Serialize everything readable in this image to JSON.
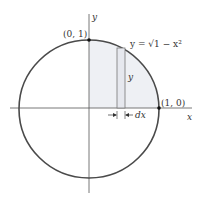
{
  "diagram": {
    "axis_x_label": "x",
    "axis_y_label": "y",
    "point_top_label": "(0, 1)",
    "point_right_label": "(1, 0)",
    "curve_label": "y = √1 − x²",
    "strip_height_label": "y",
    "strip_width_label": "dx",
    "colors": {
      "circle": "#4a4a4a",
      "axes": "#555555",
      "shade": "#eef0f4",
      "strip": "#7a7a7a"
    }
  }
}
